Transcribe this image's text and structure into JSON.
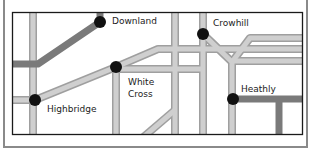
{
  "diagram": {
    "type": "schematic-road-map",
    "colors": {
      "frame": "#8a8a8a",
      "border": "#1a1a1a",
      "road_light": "#c9c9c9",
      "road_light_edge": "#9a9a9a",
      "road_dark": "#777777",
      "node": "#111111",
      "background": "#ffffff"
    },
    "places": [
      {
        "id": "downland",
        "name": "Downland",
        "x": 100,
        "y": 22
      },
      {
        "id": "crowhill",
        "name": "Crowhill",
        "x": 203,
        "y": 34
      },
      {
        "id": "white-cross",
        "name": "White Cross",
        "line1": "White",
        "line2": "Cross",
        "x": 116,
        "y": 67
      },
      {
        "id": "highbridge",
        "name": "Highbridge",
        "x": 35,
        "y": 100
      },
      {
        "id": "heathly",
        "name": "Heathly",
        "x": 233,
        "y": 99
      }
    ]
  }
}
